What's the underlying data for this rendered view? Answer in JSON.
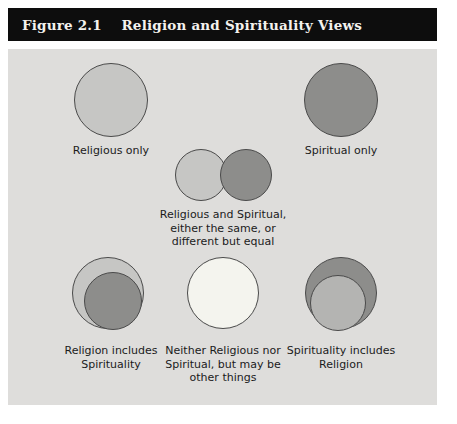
{
  "figure": {
    "number": "Figure 2.1",
    "title": "Religion and Spirituality Views",
    "title_full": "Figure 2.1    Religion and Spirituality Views"
  },
  "colors": {
    "light_gray": "#c6c6c4",
    "dark_gray": "#8d8d8b",
    "white_fill": "#f4f4ee",
    "panel_bg": "#dedddb",
    "title_bar_bg": "#0d0d0d",
    "title_text": "#f4f2ee",
    "outline": "#4a4a4a",
    "label_text": "#1b1b1b"
  },
  "cells": [
    {
      "id": "religious-only",
      "caption": "Religious only",
      "shape": "single-circle",
      "fill": "light_gray"
    },
    {
      "id": "spiritual-only",
      "caption": "Spiritual only",
      "shape": "single-circle",
      "fill": "dark_gray"
    },
    {
      "id": "religious-and-spiritual",
      "caption": "Religious and Spiritual,\neither the same, or\ndifferent but equal",
      "shape": "two-overlapping-circles",
      "fill_left": "light_gray",
      "fill_right": "dark_gray"
    },
    {
      "id": "religion-includes-spirituality",
      "caption": "Religion includes\nSpirituality",
      "shape": "nested-circles",
      "fill_outer": "light_gray",
      "fill_inner": "dark_gray"
    },
    {
      "id": "neither",
      "caption": "Neither Religious nor\nSpiritual, but may be\nother things",
      "shape": "single-circle",
      "fill": "white_fill"
    },
    {
      "id": "spirituality-includes-religion",
      "caption": "Spirituality includes\nReligion",
      "shape": "nested-circles",
      "fill_outer": "dark_gray",
      "fill_inner": "light_gray"
    }
  ]
}
